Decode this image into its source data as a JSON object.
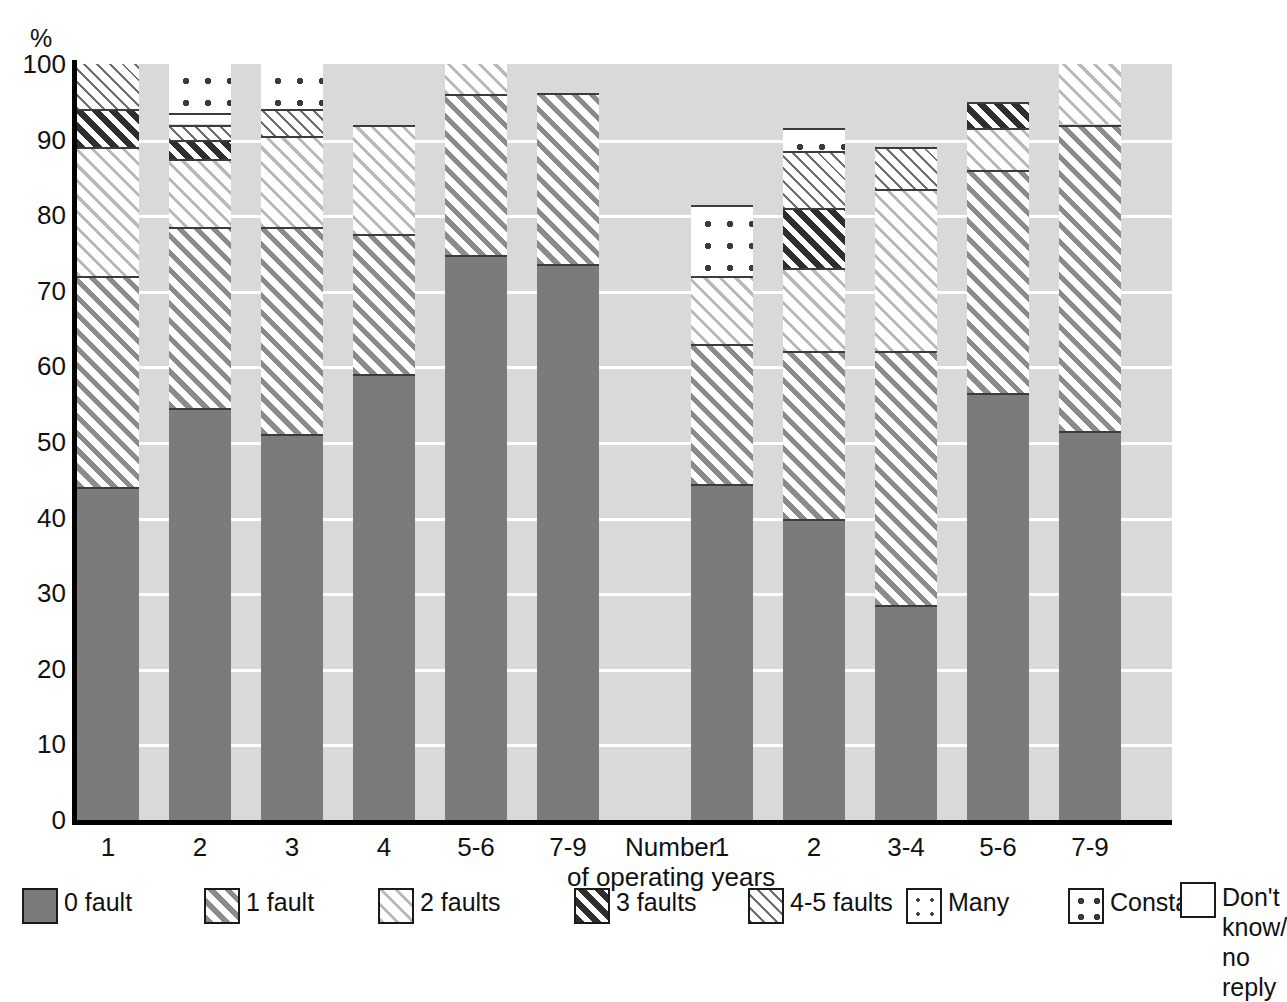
{
  "axis": {
    "y_unit": "%",
    "y_ticks": [
      "100",
      "90",
      "80",
      "70",
      "60",
      "50",
      "40",
      "30",
      "20",
      "10",
      "0"
    ],
    "x_caption_line1": "Number",
    "x_caption_line2": "of operating years"
  },
  "legend": {
    "items": [
      {
        "key": "zero",
        "label": "0 fault",
        "pattern": "solid-gray"
      },
      {
        "key": "one",
        "label": "1 fault",
        "pattern": "diagonal-medium"
      },
      {
        "key": "two",
        "label": "2 faults",
        "pattern": "diagonal-light"
      },
      {
        "key": "three",
        "label": "3 faults",
        "pattern": "diagonal-dark"
      },
      {
        "key": "four_five",
        "label": "4-5 faults",
        "pattern": "diagonal-fine"
      },
      {
        "key": "many",
        "label": "Many",
        "pattern": "dots-small"
      },
      {
        "key": "constant",
        "label": "Constant",
        "pattern": "dots-large"
      },
      {
        "key": "dont_know",
        "label": "Don't know/\nno reply",
        "pattern": "empty-white"
      }
    ]
  },
  "chart_data": {
    "type": "bar",
    "stacked": true,
    "title": "",
    "xlabel": "Number of operating years",
    "ylabel": "%",
    "ylim": [
      0,
      100
    ],
    "grid": true,
    "legend_position": "bottom",
    "categories": [
      "1",
      "2",
      "3",
      "4",
      "5-6",
      "7-9",
      "1",
      "2",
      "3-4",
      "5-6",
      "7-9"
    ],
    "group_break_after_index": 5,
    "series": [
      {
        "name": "0 fault",
        "key": "zero",
        "values": [
          44.0,
          54.5,
          51.0,
          59.0,
          74.7,
          73.5,
          44.5,
          39.8,
          28.5,
          56.5,
          51.5
        ]
      },
      {
        "name": "1 fault",
        "key": "one",
        "values": [
          28.0,
          24.0,
          27.5,
          18.5,
          21.3,
          22.7,
          18.5,
          22.2,
          33.5,
          29.5,
          40.5
        ]
      },
      {
        "name": "2 faults",
        "key": "two",
        "values": [
          17.0,
          9.0,
          12.0,
          14.5,
          4.0,
          0.0,
          9.0,
          11.0,
          21.5,
          5.5,
          8.0
        ]
      },
      {
        "name": "3 faults",
        "key": "three",
        "values": [
          5.0,
          2.5,
          0.0,
          0.0,
          2.5,
          0.0,
          0.0,
          8.0,
          0.0,
          3.5,
          0.0
        ]
      },
      {
        "name": "4-5 faults",
        "key": "four_five",
        "values": [
          6.0,
          2.0,
          3.5,
          0.0,
          0.0,
          0.0,
          0.0,
          7.5,
          5.5,
          0.0,
          0.0
        ]
      },
      {
        "name": "Many",
        "key": "many",
        "values": [
          0.0,
          1.5,
          0.0,
          0.0,
          0.0,
          0.0,
          0.0,
          0.0,
          0.0,
          0.0,
          0.0
        ]
      },
      {
        "name": "Constant",
        "key": "constant",
        "values": [
          0.0,
          6.5,
          6.0,
          0.0,
          0.0,
          0.0,
          9.3,
          3.0,
          0.0,
          0.0,
          0.0
        ]
      },
      {
        "name": "Don't know/no reply",
        "key": "dont_know",
        "values": [
          0.0,
          0.0,
          0.0,
          8.0,
          0.0,
          3.8,
          18.7,
          8.5,
          11.0,
          5.0,
          0.0
        ]
      }
    ],
    "bar_totals_visible": [
      100,
      100,
      100,
      92.0,
      98.5,
      96.2,
      81.3,
      91.5,
      89.0,
      95.0,
      100
    ]
  },
  "layout": {
    "plot_left": 77,
    "plot_top": 64,
    "plot_width": 1095,
    "plot_height": 756,
    "bar_width": 62,
    "bar_gap": 30,
    "group_gap_extra": 62
  }
}
